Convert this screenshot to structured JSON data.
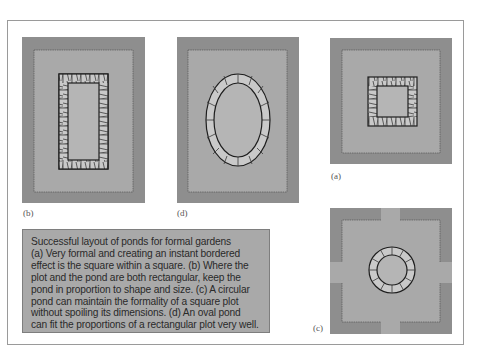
{
  "figure": {
    "title": "Successful layout of ponds for formal gardens",
    "panels": [
      {
        "id": "b",
        "label": "(b)",
        "shape": "rectangle",
        "description": "Rectangular pond in rectangular plot"
      },
      {
        "id": "d",
        "label": "(d)",
        "shape": "oval",
        "description": "Oval pond in rectangular plot"
      },
      {
        "id": "a",
        "label": "(a)",
        "shape": "square",
        "description": "Square pond within square plot"
      },
      {
        "id": "c",
        "label": "(c)",
        "shape": "circle",
        "description": "Circular pond in square plot with cross paths"
      }
    ],
    "caption_lines": [
      "Successful layout of ponds for formal gardens",
      "(a) Very formal and creating an instant bordered",
      "effect is the square within a square. (b) Where the",
      "plot and the pond are both rectangular, keep the",
      "pond in proportion to shape and size. (c) A circular",
      "pond can maintain the formality of a square plot",
      "without spoiling its dimensions. (d) An oval pond",
      "can fit the proportions of a rectangular plot very well."
    ],
    "colors": {
      "border_bed": "#8e8e8e",
      "lawn": "#a9a9a9",
      "water": "#b5b5b5",
      "stone": "#c9c9c9",
      "outline": "#2a2a2a",
      "caption_bg": "#a9a9a9"
    }
  }
}
